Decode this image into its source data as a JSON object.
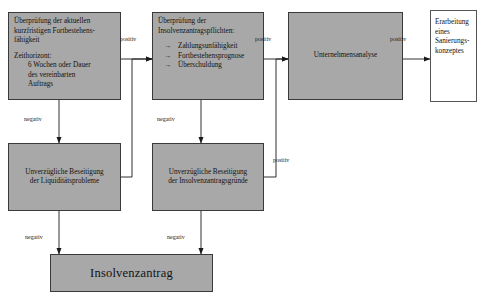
{
  "diagram": {
    "colors": {
      "node_fill": "#a8a8a8",
      "node_fill_white": "#ffffff",
      "node_stroke": "#3a3a3a",
      "edge_stroke": "#1a1a1a",
      "background": "#ffffff"
    }
  },
  "nodes": {
    "check_short_term": {
      "line1": "Überprüfung der aktuellen",
      "line2": "kurzfristigen Fortbestehens-",
      "line3": "fähigkeit",
      "line4": "Zeithorizont:",
      "line5": "6 Wochen oder Dauer",
      "line6": "des vereinbarten",
      "line7": "Auftrags"
    },
    "check_insolvency_duties": {
      "line1": "Überprüfung der",
      "line2": "Insolvenzantragspflichten:",
      "bullet_glyph": "→",
      "bullet1": "Zahlungsunfähigkeit",
      "bullet2": "Fortbestehensprognose",
      "bullet3": "Überschuldung"
    },
    "company_analysis": {
      "label": "Unternehmensanalyse"
    },
    "restructuring_concept": {
      "line1": "Erarbeitung",
      "line2": "eines",
      "line3": "Sanierungs-",
      "line4": "konzeptes"
    },
    "fix_liquidity": {
      "line1": "Unverzügliche Beseitigung",
      "line2": "der Liquiditätsprobleme"
    },
    "fix_insolvency_reasons": {
      "line1": "Unverzügliche Beseitigung",
      "line2": "der Insolvenzantragsgründe"
    },
    "insolvency_filing": {
      "label": "Insolvenzantrag"
    }
  },
  "edge_labels": {
    "positiv_1": "positiv",
    "positiv_2": "positiv",
    "positiv_3": "positiv",
    "positiv_4": "positiv",
    "negativ_1": "negativ",
    "negativ_2": "negativ",
    "negativ_3": "negativ",
    "negativ_4": "negativ"
  }
}
